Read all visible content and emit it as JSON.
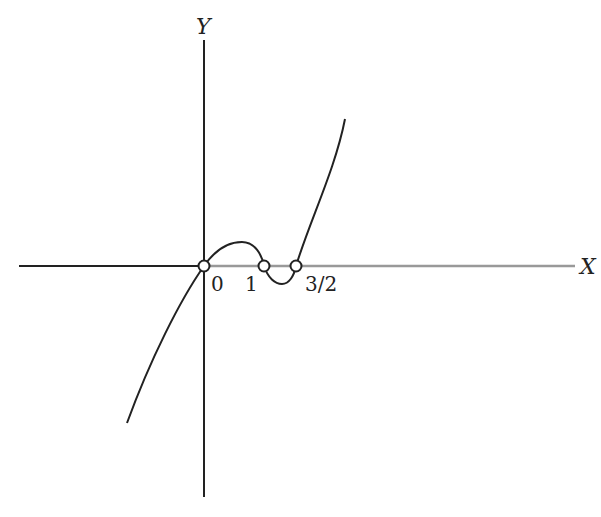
{
  "figure": {
    "type": "function-graph-sketch",
    "axes": {
      "x_label": "X",
      "y_label": "Y",
      "axis_color": "#222222",
      "positive_x_color": "#999999"
    },
    "curve_color": "#222222",
    "marked_points": [
      {
        "label": "0",
        "x": 0
      },
      {
        "label": "1",
        "x": 1
      },
      {
        "label": "3/2",
        "x": 1.5
      }
    ]
  }
}
